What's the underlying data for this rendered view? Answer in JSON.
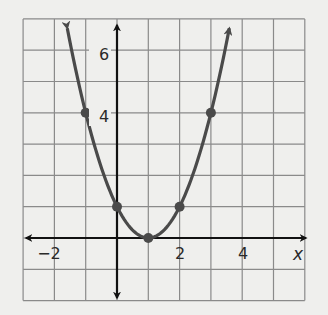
{
  "chart_data": {
    "type": "line",
    "title": "",
    "xlabel": "x",
    "ylabel": "",
    "function": "y = (x - 1)^2",
    "xlim": [
      -3,
      6
    ],
    "ylim": [
      -2,
      7
    ],
    "grid": true,
    "x_tick_labels": [
      "-2",
      "2",
      "4"
    ],
    "x_tick_values": [
      -2,
      2,
      4
    ],
    "y_tick_labels": [
      "4",
      "6"
    ],
    "y_tick_values": [
      4,
      6
    ],
    "series": [
      {
        "name": "parabola",
        "x": [
          -1,
          0,
          1,
          2,
          3
        ],
        "y": [
          4,
          1,
          0,
          1,
          4
        ],
        "marked_points": true,
        "arrows_at_ends": true,
        "color": "#4a4a4a"
      }
    ],
    "legend": null
  },
  "labels": {
    "x_axis_name": "x",
    "x_ticks": [
      "−2",
      "2",
      "4"
    ],
    "y_ticks": [
      "4",
      "6"
    ]
  },
  "colors": {
    "background": "#efefed",
    "grid": "#8a8a8a",
    "axes": "#111111",
    "curve": "#4a4a4a"
  }
}
